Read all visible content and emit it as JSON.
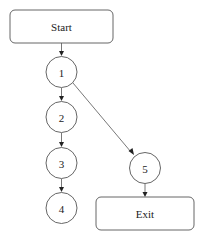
{
  "diagram": {
    "type": "control-flow-graph",
    "nodes": [
      {
        "id": "start",
        "label": "Start",
        "shape": "rounded-rect"
      },
      {
        "id": "n1",
        "label": "1",
        "shape": "circle"
      },
      {
        "id": "n2",
        "label": "2",
        "shape": "circle"
      },
      {
        "id": "n3",
        "label": "3",
        "shape": "circle"
      },
      {
        "id": "n4",
        "label": "4",
        "shape": "circle"
      },
      {
        "id": "n5",
        "label": "5",
        "shape": "circle"
      },
      {
        "id": "exit",
        "label": "Exit",
        "shape": "rounded-rect"
      }
    ],
    "edges": [
      {
        "from": "Start",
        "to": "1"
      },
      {
        "from": "1",
        "to": "2"
      },
      {
        "from": "1",
        "to": "5"
      },
      {
        "from": "2",
        "to": "3"
      },
      {
        "from": "3",
        "to": "4"
      },
      {
        "from": "5",
        "to": "Exit"
      }
    ],
    "colors": {
      "stroke": "#555555",
      "fill": "#ffffff",
      "text": "#222222"
    }
  }
}
